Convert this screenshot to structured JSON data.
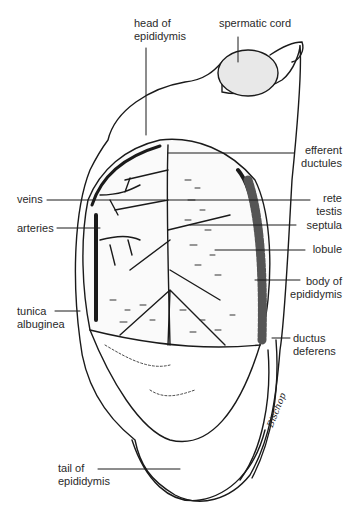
{
  "figure": {
    "signature": "Bischop"
  },
  "labels": {
    "head_of_epididymis": "head of\nepididymis",
    "spermatic_cord": "spermatic cord",
    "efferent_ductules": "efferent\nductules",
    "veins": "veins",
    "rete_testis": "rete\ntestis",
    "arteries": "arteries",
    "septula": "septula",
    "lobule": "lobule",
    "body_of_epididymis": "body of\nepididymis",
    "tunica_albuginea": "tunica\nalbuginea",
    "ductus_deferens": "ductus\ndeferens",
    "tail_of_epididymis": "tail of\nepididymis"
  },
  "colors": {
    "ink": "#1a1a1a",
    "background": "#ffffff"
  }
}
